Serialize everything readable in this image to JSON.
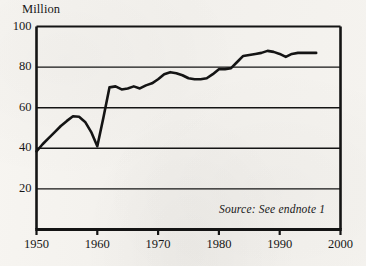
{
  "figure": {
    "background_color": "#f4f2ee",
    "ink_color": "#141414"
  },
  "chart_data": {
    "type": "line",
    "title": "",
    "subtitle": "",
    "xlabel": "",
    "ylabel": "Million",
    "ylim": [
      0,
      100
    ],
    "xlim": [
      1950,
      2000
    ],
    "grid": true,
    "grid_axis": "y",
    "legend": "none",
    "y_ticks": [
      0,
      20,
      40,
      60,
      80,
      100
    ],
    "y_tick_labels": [
      "",
      "20",
      "40",
      "60",
      "80",
      "100"
    ],
    "x_ticks": [
      1950,
      1960,
      1970,
      1980,
      1990,
      2000
    ],
    "x_tick_labels": [
      "1950",
      "1960",
      "1970",
      "1980",
      "1990",
      "2000"
    ],
    "annotations": [
      {
        "name": "source-note",
        "text": "Source: See endnote 1",
        "style": "italic",
        "x": 1986,
        "y": 8
      }
    ],
    "series": [
      {
        "name": "series-1",
        "color": "#141414",
        "line_width": 2.6,
        "x": [
          1950,
          1951,
          1952,
          1953,
          1954,
          1955,
          1956,
          1957,
          1958,
          1959,
          1960,
          1961,
          1962,
          1963,
          1964,
          1965,
          1966,
          1967,
          1968,
          1969,
          1970,
          1971,
          1972,
          1973,
          1974,
          1975,
          1976,
          1977,
          1978,
          1979,
          1980,
          1981,
          1982,
          1983,
          1984,
          1985,
          1986,
          1987,
          1988,
          1989,
          1990,
          1991,
          1992,
          1993,
          1994,
          1995,
          1996
        ],
        "values": [
          38.5,
          42.0,
          45.0,
          48.0,
          51.0,
          53.5,
          55.8,
          55.5,
          53.0,
          48.0,
          41.0,
          55.0,
          70.0,
          70.5,
          69.0,
          69.5,
          70.5,
          69.5,
          71.0,
          72.0,
          74.0,
          76.5,
          77.5,
          77.0,
          76.0,
          74.5,
          74.0,
          74.0,
          74.5,
          76.5,
          79.0,
          79.0,
          79.5,
          82.5,
          85.5,
          86.0,
          86.5,
          87.0,
          88.0,
          87.5,
          86.5,
          85.0,
          86.5,
          87.0,
          87.0,
          87.0,
          87.0
        ]
      }
    ]
  }
}
